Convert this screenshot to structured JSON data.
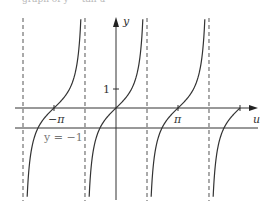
{
  "caption": "graph of y = tan u",
  "chart_data": {
    "type": "line",
    "title": "",
    "function": "y = tan u",
    "xlabel": "u",
    "ylabel": "y",
    "x_tick_labels": [
      "−π",
      "π"
    ],
    "y_tick_labels": [
      "1"
    ],
    "annotations": [
      {
        "text": "y = −1",
        "type": "horizontal_line",
        "y": -1
      }
    ],
    "asymptotes_u": [
      -4.712,
      -1.571,
      1.571,
      4.712
    ],
    "zeros_u": [
      -3.1416,
      0,
      3.1416,
      6.2832
    ],
    "grid": false,
    "series": [
      {
        "name": "tan u, branch 1",
        "x": [
          -4.6,
          -4.0,
          -3.5,
          -3.1416,
          -2.5,
          -2.0,
          -1.7
        ],
        "values": [
          8.99,
          1.16,
          0.37,
          0,
          -0.75,
          -2.19,
          -7.7
        ]
      },
      {
        "name": "tan u, branch 2",
        "x": [
          -1.45,
          -1.0,
          -0.5,
          0,
          0.5,
          1.0,
          1.45
        ],
        "values": [
          -8.17,
          -1.56,
          -0.55,
          0,
          0.55,
          1.56,
          8.17
        ]
      },
      {
        "name": "tan u, branch 3",
        "x": [
          1.7,
          2.0,
          2.5,
          3.1416,
          3.5,
          4.0,
          4.6
        ],
        "values": [
          -7.7,
          -2.19,
          -0.75,
          0,
          0.37,
          1.16,
          8.99
        ]
      },
      {
        "name": "tan u, branch 4 (partial)",
        "x": [
          4.85,
          5.2,
          5.6,
          6.0,
          6.2832
        ],
        "values": [
          -7.0,
          -1.89,
          -0.78,
          -0.29,
          0
        ]
      }
    ],
    "xlim": [
      -5.2,
      7.0
    ],
    "ylim": [
      -4.8,
      5.0
    ]
  },
  "labels": {
    "y_axis": "y",
    "u_axis": "u",
    "neg_pi": "−π",
    "pi": "π",
    "one": "1",
    "hline": "y = −1"
  }
}
